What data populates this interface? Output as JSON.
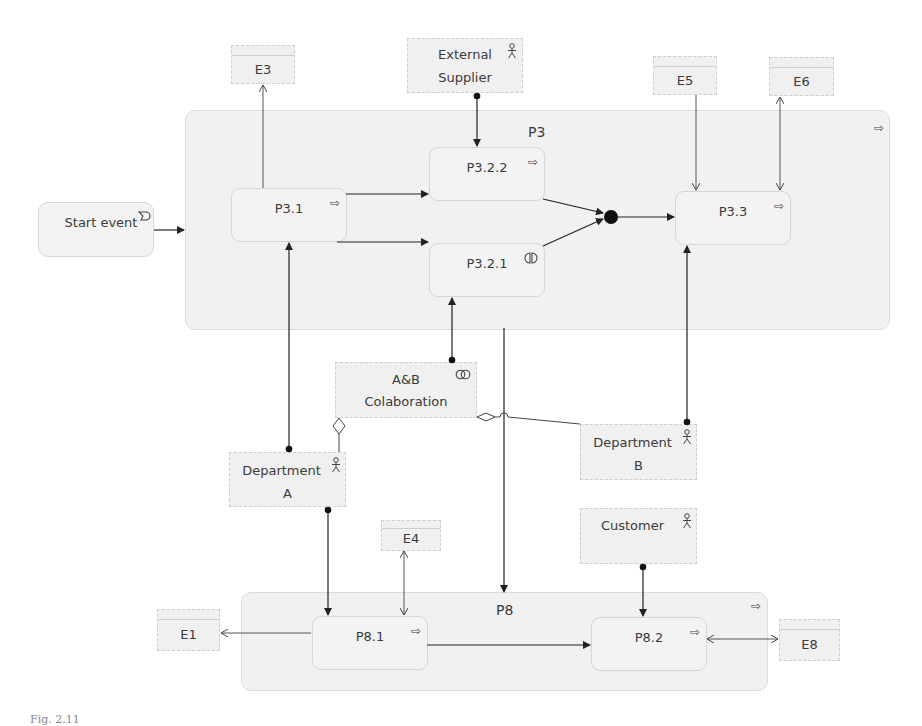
{
  "diagram": {
    "containers": {
      "p3": {
        "label": "P3",
        "icon": "process-arrow-icon"
      },
      "p8": {
        "label": "P8",
        "icon": "process-arrow-icon"
      }
    },
    "events": {
      "start": {
        "label": "Start event",
        "icon": "event-trigger-icon"
      }
    },
    "processes": {
      "p3_1": {
        "label": "P3.1",
        "icon": "process-arrow-icon"
      },
      "p3_2_2": {
        "label": "P3.2.2",
        "icon": "process-arrow-icon"
      },
      "p3_2_1": {
        "label": "P3.2.1",
        "icon": "interaction-icon"
      },
      "p3_3": {
        "label": "P3.3",
        "icon": "process-arrow-icon"
      },
      "p8_1": {
        "label": "P8.1",
        "icon": "process-arrow-icon"
      },
      "p8_2": {
        "label": "P8.2",
        "icon": "process-arrow-icon"
      }
    },
    "actors": {
      "external_supplier": {
        "line1": "External",
        "line2": "Supplier",
        "icon": "actor-icon"
      },
      "collaboration": {
        "line1": "A&B",
        "line2": "Colaboration",
        "icon": "collaboration-icon"
      },
      "department_a": {
        "line1": "Department",
        "line2": "A",
        "icon": "actor-icon"
      },
      "department_b": {
        "line1": "Department",
        "line2": "B",
        "icon": "actor-icon"
      },
      "customer": {
        "line1": "Customer",
        "line2": "",
        "icon": "actor-icon"
      }
    },
    "entities": {
      "e1": "E1",
      "e3": "E3",
      "e4": "E4",
      "e5": "E5",
      "e6": "E6",
      "e8": "E8"
    },
    "junction": {
      "type": "and-junction"
    },
    "caption": "Fig. 2.11"
  },
  "glyphs": {
    "arrow": "⇨",
    "actor": "웃",
    "collab": "◎",
    "interaction": "◐"
  }
}
